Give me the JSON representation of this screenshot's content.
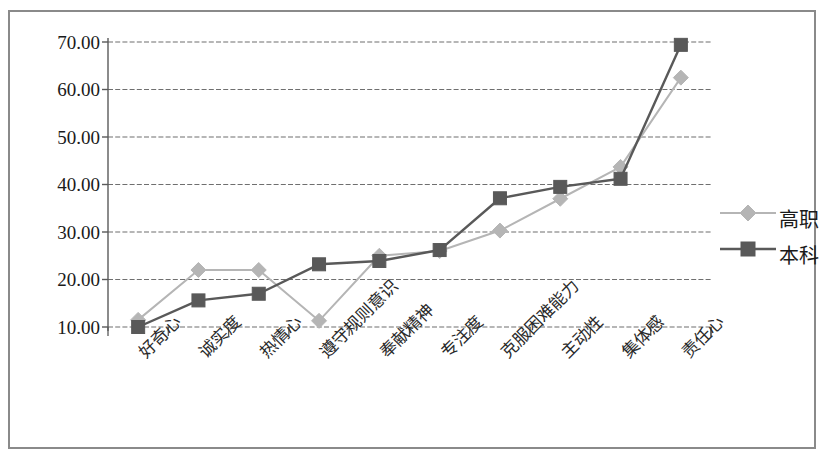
{
  "chart_data": {
    "type": "line",
    "title": "",
    "subtitle": "",
    "xlabel": "",
    "ylabel": "",
    "ylim": [
      10,
      70
    ],
    "ytick_values": [
      10,
      20,
      30,
      40,
      50,
      60,
      70
    ],
    "ytick_labels": [
      "10.00",
      "20.00",
      "30.00",
      "40.00",
      "50.00",
      "60.00",
      "70.00"
    ],
    "grid": true,
    "legend_position": "right",
    "categories": [
      "好奇心",
      "诚实度",
      "热情心",
      "遵守规则意识",
      "奉献精神",
      "专注度",
      "克服困难能力",
      "主动性",
      "集体感",
      "责任心"
    ],
    "series": [
      {
        "name": "高职",
        "color": "#b5b5b5",
        "marker": "diamond",
        "values": [
          11.5,
          22.0,
          22.0,
          11.3,
          25.0,
          26.0,
          30.3,
          37.0,
          43.7,
          62.5
        ]
      },
      {
        "name": "本科",
        "color": "#595959",
        "marker": "square",
        "values": [
          10.0,
          15.6,
          17.0,
          23.2,
          23.9,
          26.2,
          37.1,
          39.5,
          41.2,
          69.4
        ]
      }
    ]
  },
  "legend": {
    "entries": [
      {
        "label": "高职"
      },
      {
        "label": "本科"
      }
    ]
  },
  "axis": {
    "y_labels": [
      "70.00",
      "60.00",
      "50.00",
      "40.00",
      "30.00",
      "20.00",
      "10.00"
    ]
  },
  "colors": {
    "series_light": "#b5b5b5",
    "series_dark": "#595959",
    "grid": "#6f6f6f",
    "axis": "#5a5a5a",
    "frame": "#8a8a8a",
    "text": "#1a1a1a"
  }
}
